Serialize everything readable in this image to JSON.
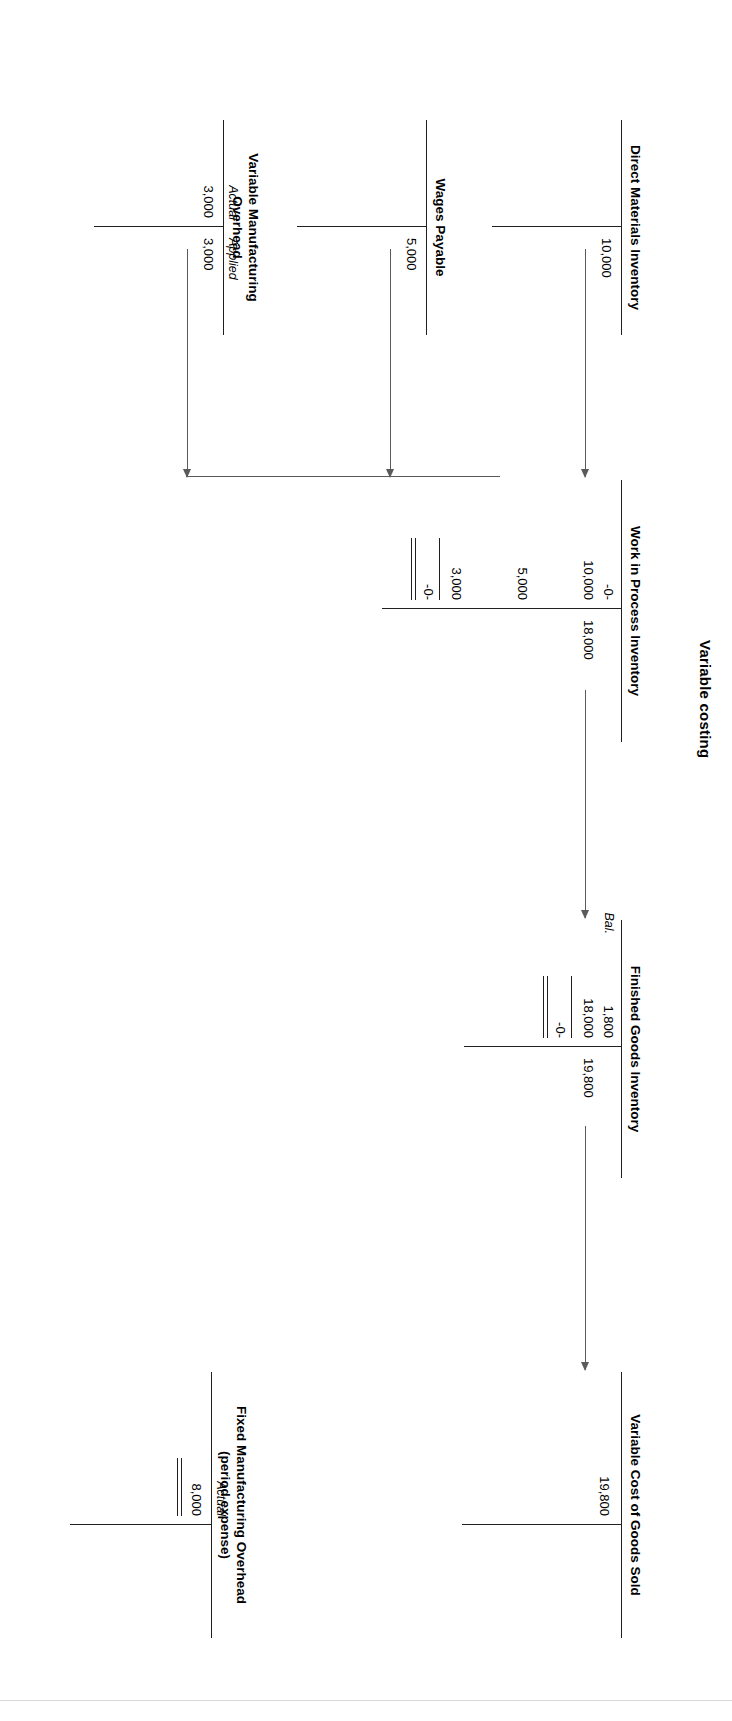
{
  "figure": {
    "title": "Variable costing"
  },
  "accounts": {
    "direct_materials": {
      "title": "Direct Materials Inventory",
      "credit_amount": "10,000"
    },
    "wages_payable": {
      "title": "Wages Payable",
      "credit_amount": "5,000"
    },
    "variable_moh": {
      "title_line1": "Variable Manufacturing",
      "title_line2": "Overhead",
      "debit_label": "Actual",
      "debit_amount": "3,000",
      "credit_label": "Applied",
      "credit_amount": "3,000"
    },
    "work_in_process": {
      "title": "Work in Process Inventory",
      "beginning_balance": "-0-",
      "debit_materials": "10,000",
      "debit_labor": "5,000",
      "debit_overhead": "3,000",
      "credit_transferred": "18,000",
      "ending_balance": "-0-"
    },
    "finished_goods": {
      "title": "Finished Goods Inventory",
      "beginning_balance_label": "Bal.",
      "beginning_balance": "1,800",
      "debit_transferred_in": "18,000",
      "credit_cogs": "19,800",
      "ending_balance": "-0-"
    },
    "variable_cogs": {
      "title": "Variable Cost of Goods Sold",
      "debit_amount": "19,800"
    },
    "fixed_moh": {
      "title_line1": "Fixed Manufacturing Overhead",
      "title_line2": "(period expense)",
      "debit_label": "Actual",
      "debit_amount": "8,000"
    }
  },
  "colors": {
    "ink": "#231f20",
    "connector": "#5a5a5a"
  }
}
